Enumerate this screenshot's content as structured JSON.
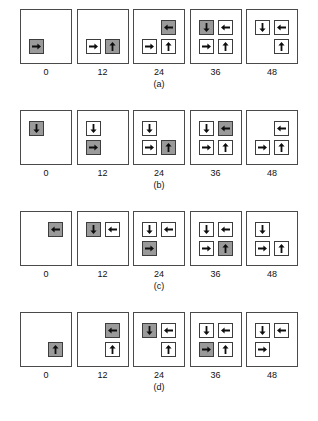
{
  "figure": {
    "type": "panel-sequence-diagram",
    "time_labels": [
      "0",
      "12",
      "24",
      "36",
      "48"
    ],
    "colors": {
      "shaded_cell": "#9a9a9a",
      "empty_cell": "#ffffff",
      "border": "#3d3d3d",
      "panel_border": "#4a4a4a",
      "background": "#ffffff",
      "text": "#111111"
    },
    "legend_note": "Shaded cells are newly active; white cells are previously placed. Arrows show orientation.",
    "rows": [
      {
        "caption": "(a)",
        "panels": [
          {
            "time": "0",
            "cells": [
              {
                "row": 0,
                "col": 0,
                "state": "empty",
                "arrow": ""
              },
              {
                "row": 0,
                "col": 1,
                "state": "empty",
                "arrow": ""
              },
              {
                "row": 1,
                "col": 0,
                "state": "shaded",
                "arrow": "right"
              },
              {
                "row": 1,
                "col": 1,
                "state": "empty",
                "arrow": ""
              }
            ]
          },
          {
            "time": "12",
            "cells": [
              {
                "row": 0,
                "col": 0,
                "state": "empty",
                "arrow": ""
              },
              {
                "row": 0,
                "col": 1,
                "state": "empty",
                "arrow": ""
              },
              {
                "row": 1,
                "col": 0,
                "state": "white",
                "arrow": "right"
              },
              {
                "row": 1,
                "col": 1,
                "state": "shaded",
                "arrow": "up"
              }
            ]
          },
          {
            "time": "24",
            "cells": [
              {
                "row": 0,
                "col": 0,
                "state": "empty",
                "arrow": ""
              },
              {
                "row": 0,
                "col": 1,
                "state": "shaded",
                "arrow": "left"
              },
              {
                "row": 1,
                "col": 0,
                "state": "white",
                "arrow": "right"
              },
              {
                "row": 1,
                "col": 1,
                "state": "white",
                "arrow": "up"
              }
            ]
          },
          {
            "time": "36",
            "cells": [
              {
                "row": 0,
                "col": 0,
                "state": "shaded",
                "arrow": "down"
              },
              {
                "row": 0,
                "col": 1,
                "state": "white",
                "arrow": "left"
              },
              {
                "row": 1,
                "col": 0,
                "state": "white",
                "arrow": "right"
              },
              {
                "row": 1,
                "col": 1,
                "state": "white",
                "arrow": "up"
              }
            ]
          },
          {
            "time": "48",
            "cells": [
              {
                "row": 0,
                "col": 0,
                "state": "white",
                "arrow": "down"
              },
              {
                "row": 0,
                "col": 1,
                "state": "white",
                "arrow": "left"
              },
              {
                "row": 1,
                "col": 0,
                "state": "empty",
                "arrow": ""
              },
              {
                "row": 1,
                "col": 1,
                "state": "white",
                "arrow": "up"
              }
            ]
          }
        ]
      },
      {
        "caption": "(b)",
        "panels": [
          {
            "time": "0",
            "cells": [
              {
                "row": 0,
                "col": 0,
                "state": "shaded",
                "arrow": "down"
              },
              {
                "row": 0,
                "col": 1,
                "state": "empty",
                "arrow": ""
              },
              {
                "row": 1,
                "col": 0,
                "state": "empty",
                "arrow": ""
              },
              {
                "row": 1,
                "col": 1,
                "state": "empty",
                "arrow": ""
              }
            ]
          },
          {
            "time": "12",
            "cells": [
              {
                "row": 0,
                "col": 0,
                "state": "white",
                "arrow": "down"
              },
              {
                "row": 0,
                "col": 1,
                "state": "empty",
                "arrow": ""
              },
              {
                "row": 1,
                "col": 0,
                "state": "shaded",
                "arrow": "right"
              },
              {
                "row": 1,
                "col": 1,
                "state": "empty",
                "arrow": ""
              }
            ]
          },
          {
            "time": "24",
            "cells": [
              {
                "row": 0,
                "col": 0,
                "state": "white",
                "arrow": "down"
              },
              {
                "row": 0,
                "col": 1,
                "state": "empty",
                "arrow": ""
              },
              {
                "row": 1,
                "col": 0,
                "state": "white",
                "arrow": "right"
              },
              {
                "row": 1,
                "col": 1,
                "state": "shaded",
                "arrow": "up"
              }
            ]
          },
          {
            "time": "36",
            "cells": [
              {
                "row": 0,
                "col": 0,
                "state": "white",
                "arrow": "down"
              },
              {
                "row": 0,
                "col": 1,
                "state": "shaded",
                "arrow": "left"
              },
              {
                "row": 1,
                "col": 0,
                "state": "white",
                "arrow": "right"
              },
              {
                "row": 1,
                "col": 1,
                "state": "white",
                "arrow": "up"
              }
            ]
          },
          {
            "time": "48",
            "cells": [
              {
                "row": 0,
                "col": 0,
                "state": "empty",
                "arrow": ""
              },
              {
                "row": 0,
                "col": 1,
                "state": "white",
                "arrow": "left"
              },
              {
                "row": 1,
                "col": 0,
                "state": "white",
                "arrow": "right"
              },
              {
                "row": 1,
                "col": 1,
                "state": "white",
                "arrow": "up"
              }
            ]
          }
        ]
      },
      {
        "caption": "(c)",
        "panels": [
          {
            "time": "0",
            "cells": [
              {
                "row": 0,
                "col": 0,
                "state": "empty",
                "arrow": ""
              },
              {
                "row": 0,
                "col": 1,
                "state": "shaded",
                "arrow": "left"
              },
              {
                "row": 1,
                "col": 0,
                "state": "empty",
                "arrow": ""
              },
              {
                "row": 1,
                "col": 1,
                "state": "empty",
                "arrow": ""
              }
            ]
          },
          {
            "time": "12",
            "cells": [
              {
                "row": 0,
                "col": 0,
                "state": "shaded",
                "arrow": "down"
              },
              {
                "row": 0,
                "col": 1,
                "state": "white",
                "arrow": "left"
              },
              {
                "row": 1,
                "col": 0,
                "state": "empty",
                "arrow": ""
              },
              {
                "row": 1,
                "col": 1,
                "state": "empty",
                "arrow": ""
              }
            ]
          },
          {
            "time": "24",
            "cells": [
              {
                "row": 0,
                "col": 0,
                "state": "white",
                "arrow": "down"
              },
              {
                "row": 0,
                "col": 1,
                "state": "white",
                "arrow": "left"
              },
              {
                "row": 1,
                "col": 0,
                "state": "shaded",
                "arrow": "right"
              },
              {
                "row": 1,
                "col": 1,
                "state": "empty",
                "arrow": ""
              }
            ]
          },
          {
            "time": "36",
            "cells": [
              {
                "row": 0,
                "col": 0,
                "state": "white",
                "arrow": "down"
              },
              {
                "row": 0,
                "col": 1,
                "state": "white",
                "arrow": "left"
              },
              {
                "row": 1,
                "col": 0,
                "state": "white",
                "arrow": "right"
              },
              {
                "row": 1,
                "col": 1,
                "state": "shaded",
                "arrow": "up"
              }
            ]
          },
          {
            "time": "48",
            "cells": [
              {
                "row": 0,
                "col": 0,
                "state": "white",
                "arrow": "down"
              },
              {
                "row": 0,
                "col": 1,
                "state": "empty",
                "arrow": ""
              },
              {
                "row": 1,
                "col": 0,
                "state": "white",
                "arrow": "right"
              },
              {
                "row": 1,
                "col": 1,
                "state": "white",
                "arrow": "up"
              }
            ]
          }
        ]
      },
      {
        "caption": "(d)",
        "panels": [
          {
            "time": "0",
            "cells": [
              {
                "row": 0,
                "col": 0,
                "state": "empty",
                "arrow": ""
              },
              {
                "row": 0,
                "col": 1,
                "state": "empty",
                "arrow": ""
              },
              {
                "row": 1,
                "col": 0,
                "state": "empty",
                "arrow": ""
              },
              {
                "row": 1,
                "col": 1,
                "state": "shaded",
                "arrow": "up"
              }
            ]
          },
          {
            "time": "12",
            "cells": [
              {
                "row": 0,
                "col": 0,
                "state": "empty",
                "arrow": ""
              },
              {
                "row": 0,
                "col": 1,
                "state": "shaded",
                "arrow": "left"
              },
              {
                "row": 1,
                "col": 0,
                "state": "empty",
                "arrow": ""
              },
              {
                "row": 1,
                "col": 1,
                "state": "white",
                "arrow": "up"
              }
            ]
          },
          {
            "time": "24",
            "cells": [
              {
                "row": 0,
                "col": 0,
                "state": "shaded",
                "arrow": "down"
              },
              {
                "row": 0,
                "col": 1,
                "state": "white",
                "arrow": "left"
              },
              {
                "row": 1,
                "col": 0,
                "state": "empty",
                "arrow": ""
              },
              {
                "row": 1,
                "col": 1,
                "state": "white",
                "arrow": "up"
              }
            ]
          },
          {
            "time": "36",
            "cells": [
              {
                "row": 0,
                "col": 0,
                "state": "white",
                "arrow": "down"
              },
              {
                "row": 0,
                "col": 1,
                "state": "white",
                "arrow": "left"
              },
              {
                "row": 1,
                "col": 0,
                "state": "shaded",
                "arrow": "right"
              },
              {
                "row": 1,
                "col": 1,
                "state": "white",
                "arrow": "up"
              }
            ]
          },
          {
            "time": "48",
            "cells": [
              {
                "row": 0,
                "col": 0,
                "state": "white",
                "arrow": "down"
              },
              {
                "row": 0,
                "col": 1,
                "state": "white",
                "arrow": "left"
              },
              {
                "row": 1,
                "col": 0,
                "state": "white",
                "arrow": "right"
              },
              {
                "row": 1,
                "col": 1,
                "state": "empty",
                "arrow": ""
              }
            ]
          }
        ]
      }
    ]
  }
}
